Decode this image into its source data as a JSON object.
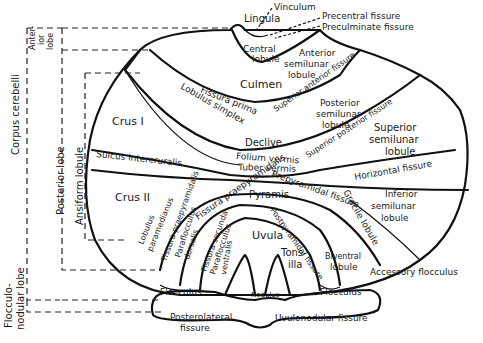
{
  "diagram": {
    "side_brackets": {
      "corpus_cerebelli": "Corpus cerebelli",
      "anterior_lobe": [
        "Anter-",
        "ior",
        "lobe"
      ],
      "posterior_lobe": "Posterior lobe",
      "ansiform_lobule": "Ansiform lobule",
      "flocculonodular_lobe": [
        "Flocculo-",
        "nodular lobe"
      ]
    },
    "top_labels": {
      "vinculum": "Vinculum",
      "lingula": "Lingula",
      "precentral_fissure": "Precentral fissure",
      "preculminate_fissure": "Preculminate fissure"
    },
    "regions": {
      "central_lobule": [
        "Central",
        "lobule"
      ],
      "anterior_semilunar_lobule": [
        "Anterior",
        "semilunar",
        "lobule"
      ],
      "culmen": "Culmen",
      "fissura_prima": "Fissura prima",
      "superior_anterior_fissure": "Superior anterior fissure",
      "crus_1": "Crus I",
      "lobulus_simplex": "Lobulus simplex",
      "posterior_semilunar_lobule": [
        "Posterior",
        "semilunar",
        "lobule"
      ],
      "superior_posterior_fissure": "Superior posterior fissure",
      "declive": "Declive",
      "superior_semilunar_lobule": [
        "Superior",
        "semilunar",
        "lobule"
      ],
      "folium_vermis": "Folium vermis",
      "tuber_vermis": "Tuber vermis",
      "sulcus_intercruralis": "Sulcus intercruralis",
      "horizontal_fissure": "Horizontal fissure",
      "crus_2": "Crus II",
      "fissura_praepyramidalis": "Fissura praepyramidalis",
      "prepyramidal_fissure": "Prepyramidal fissure",
      "pyramis": "Pyramis",
      "gracile_lobule": "Gracile lobule",
      "inferior_semilunar_lobule": [
        "Inferior",
        "semilunar",
        "lobule"
      ],
      "lobulus_paramedianus": [
        "Lobulus",
        "paramedianus"
      ],
      "tissura_praepyramidalis": "Tissura praepyramidalis",
      "paraflocculus_dorsalis": [
        "Paraflocculus",
        "dorsalis"
      ],
      "fissura_secunda": "Fissura secunda",
      "paraflocculus_ventralis": [
        "Paraflocculus",
        "ventralis"
      ],
      "postpyramidal_fissure": "Postpyramidal fissure",
      "uvula": "Uvula",
      "tonsilla": [
        "Tons-",
        "illa"
      ],
      "biventral_lobule": [
        "Biventral",
        "lobule"
      ],
      "flocculus_left": "Flocculus",
      "flocculus_right": "Flocculus",
      "nodulus": "Nodulus"
    },
    "bottom_labels": {
      "accessory_flocculus": "Accessory flocculus",
      "posterolateral_fissure": [
        "Posterolateral",
        "fissure"
      ],
      "uvulonodular_fissure": "Uvulonodular fissure"
    }
  }
}
